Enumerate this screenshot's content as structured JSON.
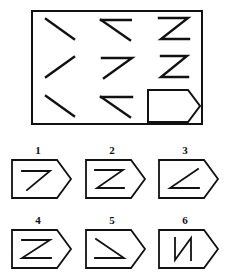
{
  "test": {
    "kind": "raven-progressive-matrices",
    "title": "",
    "stroke_color": "#111111",
    "background_color": "#ffffff"
  },
  "matrix": {
    "name": "matrix-frame",
    "rows": 3,
    "columns": 3,
    "cells": [
      {
        "row": 1,
        "col": 1,
        "figure": "backslash-line",
        "label": "\\"
      },
      {
        "row": 1,
        "col": 2,
        "figure": "less-than-bracket",
        "label": "<"
      },
      {
        "row": 1,
        "col": 3,
        "figure": "sigma-reverse-z",
        "label": "Σ"
      },
      {
        "row": 2,
        "col": 1,
        "figure": "forward-slash-line",
        "label": "/"
      },
      {
        "row": 2,
        "col": 2,
        "figure": "seven-shape",
        "label": "7"
      },
      {
        "row": 2,
        "col": 3,
        "figure": "z-shape",
        "label": "Z"
      },
      {
        "row": 3,
        "col": 1,
        "figure": "backslash-line",
        "label": "\\"
      },
      {
        "row": 3,
        "col": 2,
        "figure": "less-than-bracket",
        "label": "<"
      },
      {
        "row": 3,
        "col": 3,
        "figure": "missing-pentagon",
        "label": ""
      }
    ]
  },
  "options": {
    "name": "answer-options",
    "items": [
      {
        "number": "1",
        "figure": "seven-shape",
        "label": "7"
      },
      {
        "number": "2",
        "figure": "sigma-reverse-z",
        "label": "Σ"
      },
      {
        "number": "3",
        "figure": "less-than-open-up",
        "label": "∠"
      },
      {
        "number": "4",
        "figure": "z-shape",
        "label": "Z"
      },
      {
        "number": "5",
        "figure": "greater-than-down",
        "label": "↘"
      },
      {
        "number": "6",
        "figure": "n-shape",
        "label": "N"
      }
    ]
  }
}
